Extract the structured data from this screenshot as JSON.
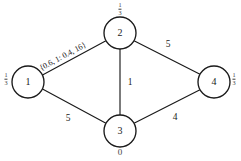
{
  "diagram": {
    "stroke_color": "#1a1a1a",
    "fill_color": "#ffffff",
    "nodes": [
      {
        "id": "1",
        "label": "1",
        "cx": 28,
        "cy": 82,
        "r": 16
      },
      {
        "id": "2",
        "label": "2",
        "cx": 120,
        "cy": 33,
        "r": 16
      },
      {
        "id": "3",
        "label": "3",
        "cx": 120,
        "cy": 131,
        "r": 16
      },
      {
        "id": "4",
        "label": "4",
        "cx": 214,
        "cy": 82,
        "r": 16
      }
    ],
    "edges": [
      {
        "from": "1",
        "to": "2",
        "weight": "{0.6, 1: 0.4, 16}",
        "rotated": true
      },
      {
        "from": "2",
        "to": "4",
        "weight": "5"
      },
      {
        "from": "2",
        "to": "3",
        "weight": "1"
      },
      {
        "from": "1",
        "to": "3",
        "weight": "5"
      },
      {
        "from": "3",
        "to": "4",
        "weight": "4"
      }
    ],
    "annotations": [
      {
        "for": "3",
        "text": "0",
        "x": 120,
        "y": 152
      }
    ],
    "fractions": [
      {
        "for": "2",
        "num": "1",
        "den": "3",
        "x": 120,
        "y": 9
      },
      {
        "for": "1",
        "num": "1",
        "den": "3",
        "x": 6,
        "y": 79
      },
      {
        "for": "4",
        "num": "1",
        "den": "3",
        "x": 234,
        "y": 79
      }
    ],
    "edge_weight_positions": {
      "e24": {
        "x": 168,
        "y": 45
      },
      "e23": {
        "x": 130,
        "y": 83
      },
      "e13": {
        "x": 68,
        "y": 119
      },
      "e34": {
        "x": 175,
        "y": 118
      }
    },
    "edge_12_label": {
      "x": 40,
      "y": 64,
      "angle": -28
    }
  }
}
